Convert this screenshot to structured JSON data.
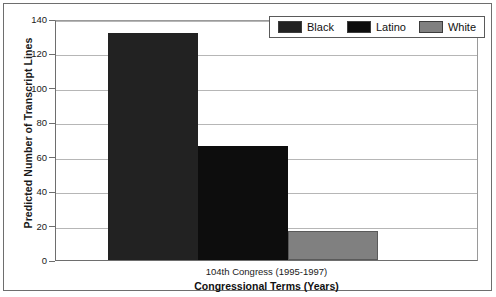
{
  "chart_data": {
    "type": "bar",
    "title": "",
    "categories": [
      "104th Congress (1995-1997)"
    ],
    "series": [
      {
        "name": "Black",
        "values": [
          132
        ],
        "color": "#222222"
      },
      {
        "name": "Latino",
        "values": [
          66
        ],
        "color": "#0d0d0d"
      },
      {
        "name": "White",
        "values": [
          17
        ],
        "color": "#808080"
      }
    ],
    "xlabel": "Congressional Terms (Years)",
    "ylabel": "Predicted Number of Transcript Lines",
    "ylim": [
      0,
      140
    ],
    "ytick_labels": [
      "0",
      "20",
      "40",
      "60",
      "80",
      "100",
      "120",
      "140"
    ],
    "ytick_values": [
      0,
      20,
      40,
      60,
      80,
      100,
      120,
      140
    ],
    "grid": true,
    "legend_position": "top-right"
  },
  "legend": {
    "items": [
      {
        "label": "Black",
        "color": "#222222"
      },
      {
        "label": "Latino",
        "color": "#0d0d0d"
      },
      {
        "label": "White",
        "color": "#808080"
      }
    ]
  },
  "axes": {
    "y_title": "Predicted Number of Transcript Lines",
    "x_title": "Congressional Terms (Years)",
    "x_category": "104th Congress (1995-1997)"
  }
}
